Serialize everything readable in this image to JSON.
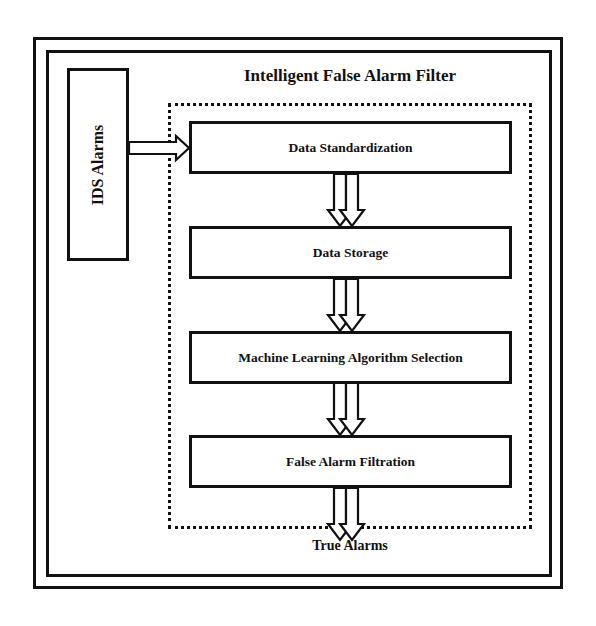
{
  "diagram": {
    "title": "Intelligent False Alarm Filter",
    "input": {
      "label": "IDS Alarms"
    },
    "steps": [
      {
        "label": "Data Standardization"
      },
      {
        "label": "Data Storage"
      },
      {
        "label": "Machine Learning Algorithm Selection"
      },
      {
        "label": "False Alarm Filtration"
      }
    ],
    "output": {
      "label": "True Alarms"
    },
    "edges": [
      {
        "from": "IDS Alarms",
        "to": "Data Standardization",
        "style": "hollow-arrow"
      },
      {
        "from": "Data Standardization",
        "to": "Data Storage",
        "style": "double-hollow-arrow"
      },
      {
        "from": "Data Storage",
        "to": "Machine Learning Algorithm Selection",
        "style": "double-hollow-arrow"
      },
      {
        "from": "Machine Learning Algorithm Selection",
        "to": "False Alarm Filtration",
        "style": "double-hollow-arrow"
      },
      {
        "from": "False Alarm Filtration",
        "to": "True Alarms",
        "style": "double-hollow-arrow"
      }
    ],
    "colors": {
      "stroke": "#111111",
      "background": "#ffffff"
    }
  }
}
